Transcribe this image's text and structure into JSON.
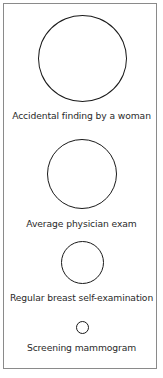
{
  "diagram": {
    "items": [
      {
        "label": "Accidental finding by a woman",
        "relative_size": "largest"
      },
      {
        "label": "Average physician exam",
        "relative_size": "large"
      },
      {
        "label": "Regular breast self-examination",
        "relative_size": "medium"
      },
      {
        "label": "Screening mammogram",
        "relative_size": "smallest"
      }
    ]
  }
}
